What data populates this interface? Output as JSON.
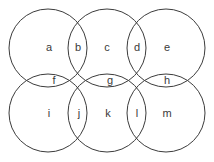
{
  "diagram": {
    "type": "venn-grid",
    "canvas": {
      "width": 214,
      "height": 162,
      "background": "#ffffff"
    },
    "stroke": {
      "color": "#3c3c3c",
      "width": 1
    },
    "circles": [
      {
        "id": "circle-top-left",
        "cx": 48,
        "cy": 48,
        "r": 39
      },
      {
        "id": "circle-top-center",
        "cx": 107,
        "cy": 48,
        "r": 39
      },
      {
        "id": "circle-top-right",
        "cx": 166,
        "cy": 48,
        "r": 39
      },
      {
        "id": "circle-bottom-left",
        "cx": 48,
        "cy": 113,
        "r": 39
      },
      {
        "id": "circle-bottom-center",
        "cx": 107,
        "cy": 113,
        "r": 39
      },
      {
        "id": "circle-bottom-right",
        "cx": 166,
        "cy": 113,
        "r": 39
      }
    ],
    "labels": [
      {
        "id": "label-a",
        "text": "a",
        "x": 49,
        "y": 48
      },
      {
        "id": "label-b",
        "text": "b",
        "x": 78,
        "y": 48
      },
      {
        "id": "label-c",
        "text": "c",
        "x": 107,
        "y": 48
      },
      {
        "id": "label-d",
        "text": "d",
        "x": 137,
        "y": 48
      },
      {
        "id": "label-e",
        "text": "e",
        "x": 167,
        "y": 48
      },
      {
        "id": "label-f",
        "text": "f",
        "x": 54,
        "y": 81
      },
      {
        "id": "label-g",
        "text": "g",
        "x": 110,
        "y": 81
      },
      {
        "id": "label-h",
        "text": "h",
        "x": 167,
        "y": 81
      },
      {
        "id": "label-i",
        "text": "i",
        "x": 49,
        "y": 114
      },
      {
        "id": "label-j",
        "text": "j",
        "x": 79,
        "y": 114
      },
      {
        "id": "label-k",
        "text": "k",
        "x": 108,
        "y": 114
      },
      {
        "id": "label-l",
        "text": "l",
        "x": 137,
        "y": 114
      },
      {
        "id": "label-m",
        "text": "m",
        "x": 167,
        "y": 114
      }
    ]
  }
}
